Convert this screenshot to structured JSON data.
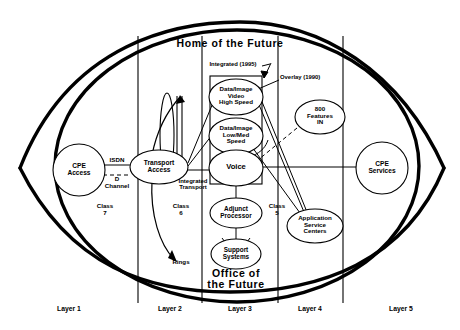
{
  "diagram": {
    "title_top": "Home of the Future",
    "title_bottom": "Office of\nthe Future",
    "nodes": {
      "cpe_access": "CPE\nAccess",
      "transport_access": "Transport\nAccess",
      "data_video_high": "Data/Image\nVideo\nHigh Speed",
      "data_low_med": "Data/Image\nLow/Med\nSpeed",
      "voice": "Voice",
      "adjunct_processor": "Adjunct\nProcessor",
      "support_systems": "Support\nSystems",
      "features_800": "800\nFeatures\nIN",
      "app_service_centers": "Application\nService\nCenters",
      "cpe_services": "CPE\nServices"
    },
    "annotations": {
      "isdn": "ISDN",
      "d_channel": "D\nChannel",
      "class7": "Class\n7",
      "class6": "Class\n6",
      "class5": "Class\n5",
      "rings": "Rings",
      "integrated_transport": "Integrated\nTransport",
      "integrated_1995": "Integrated  (1995)",
      "overlay_1990": "Overlay  (1990)"
    },
    "layers": [
      {
        "label": "Layer 1",
        "x": 69
      },
      {
        "label": "Layer 2",
        "x": 170
      },
      {
        "label": "Layer 3",
        "x": 240
      },
      {
        "label": "Layer 4",
        "x": 310
      },
      {
        "label": "Layer 5",
        "x": 401
      }
    ],
    "colors": {
      "stroke": "#000000",
      "background": "#ffffff",
      "heavy_stroke": "#000000"
    }
  }
}
